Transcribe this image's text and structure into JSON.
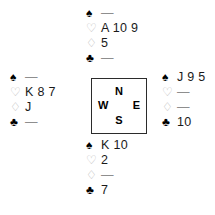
{
  "diagram": {
    "type": "bridge-deal",
    "background_color": "#ffffff",
    "suit_symbols": {
      "spade": "♠",
      "heart": "♡",
      "diamond": "♢",
      "club": "♣"
    },
    "suit_colors": {
      "spade": "#000000",
      "heart": "#b9b9b9",
      "diamond": "#b9b9b9",
      "club": "#000000"
    },
    "void_marker": "—",
    "compass": {
      "north": "N",
      "west": "W",
      "east": "E",
      "south": "S",
      "border_color": "#2b2b2b"
    },
    "hands": {
      "north": {
        "label": "North",
        "spades": "—",
        "hearts": "A 10 9",
        "diamonds": "5",
        "clubs": "—"
      },
      "west": {
        "label": "West",
        "spades": "—",
        "hearts": "K 8 7",
        "diamonds": "J",
        "clubs": "—"
      },
      "east": {
        "label": "East",
        "spades": "J 9 5",
        "hearts": "—",
        "diamonds": "—",
        "clubs": "10"
      },
      "south": {
        "label": "South",
        "spades": "K 10",
        "hearts": "2",
        "diamonds": "—",
        "clubs": "7"
      }
    }
  }
}
